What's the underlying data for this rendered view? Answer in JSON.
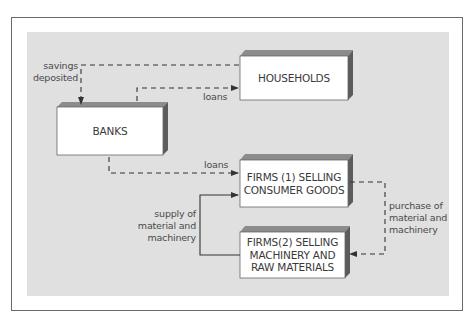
{
  "diagram": {
    "type": "circular-flow",
    "colors": {
      "panel": "#e0e0e0",
      "box_face": "#ffffff",
      "box_top": "#8c8c8c",
      "box_side": "#5c5c5c",
      "line": "#333333",
      "frame": "#6a6a6a"
    },
    "nodes": {
      "households": {
        "label": "HOUSEHOLDS"
      },
      "banks": {
        "label": "BANKS"
      },
      "firms1": {
        "label_line1": "FIRMS (1) SELLING",
        "label_line2": "CONSUMER GOODS"
      },
      "firms2": {
        "label_line1": "FIRMS(2) SELLING",
        "label_line2": "MACHINERY AND",
        "label_line3": "RAW MATERIALS"
      }
    },
    "flows": {
      "savings": {
        "line1": "savings",
        "line2": "deposited",
        "from": "households",
        "to": "banks",
        "style": "dashed"
      },
      "loans_households": {
        "label": "loans",
        "from": "banks",
        "to": "households",
        "style": "dashed"
      },
      "loans_firms": {
        "label": "loans",
        "from": "banks",
        "to": "firms1",
        "style": "dashed"
      },
      "purchase": {
        "line1": "purchase of",
        "line2": "material and",
        "line3": "machinery",
        "from": "firms1",
        "to": "firms2",
        "style": "dashed"
      },
      "supply": {
        "line1": "supply of",
        "line2": "material and",
        "line3": "machinery",
        "from": "firms2",
        "to": "firms1",
        "style": "solid"
      }
    }
  }
}
